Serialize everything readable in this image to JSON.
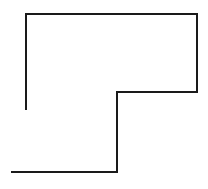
{
  "canvas": {
    "width": 208,
    "height": 189,
    "background_color": "#ffffff",
    "title": "polyline-shape"
  },
  "shape": {
    "name": "open-rectilinear-polyline",
    "description": "Open L-shaped rectilinear polyline outline",
    "stroke_color": "#1a1a1a",
    "stroke_width": 2,
    "fill": "none",
    "closed": false,
    "vertices": [
      {
        "x": 26,
        "y": 110
      },
      {
        "x": 26,
        "y": 14
      },
      {
        "x": 197,
        "y": 14
      },
      {
        "x": 197,
        "y": 92
      },
      {
        "x": 117,
        "y": 92
      },
      {
        "x": 117,
        "y": 172
      },
      {
        "x": 11,
        "y": 172
      }
    ],
    "points_attr": "26,110 26,14 197,14 197,92 117,92 117,172 11,172",
    "segments": [
      {
        "name": "left-vertical-segment",
        "orientation": "vertical",
        "from": [
          26,
          110
        ],
        "to": [
          26,
          14
        ],
        "length": 96
      },
      {
        "name": "top-horizontal-segment",
        "orientation": "horizontal",
        "from": [
          26,
          14
        ],
        "to": [
          197,
          14
        ],
        "length": 171
      },
      {
        "name": "right-vertical-segment",
        "orientation": "vertical",
        "from": [
          197,
          14
        ],
        "to": [
          197,
          92
        ],
        "length": 78
      },
      {
        "name": "middle-horizontal-segment",
        "orientation": "horizontal",
        "from": [
          197,
          92
        ],
        "to": [
          117,
          92
        ],
        "length": 80
      },
      {
        "name": "middle-vertical-segment",
        "orientation": "vertical",
        "from": [
          117,
          92
        ],
        "to": [
          117,
          172
        ],
        "length": 80
      },
      {
        "name": "bottom-horizontal-segment",
        "orientation": "horizontal",
        "from": [
          117,
          172
        ],
        "to": [
          11,
          172
        ],
        "length": 106
      }
    ]
  }
}
